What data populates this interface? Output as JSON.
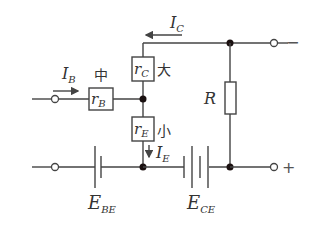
{
  "diagram": {
    "type": "transistor equivalent circuit",
    "components": {
      "rB": {
        "symbol": "r",
        "subscript": "B",
        "annotation": "中"
      },
      "rC": {
        "symbol": "r",
        "subscript": "C",
        "annotation": "大"
      },
      "rE": {
        "symbol": "r",
        "subscript": "E",
        "annotation": "小"
      },
      "R": {
        "symbol": "R"
      },
      "EBE": {
        "symbol": "E",
        "subscript": "BE"
      },
      "ECE": {
        "symbol": "E",
        "subscript": "CE"
      }
    },
    "currents": {
      "IB": {
        "symbol": "I",
        "subscript": "B",
        "direction": "right"
      },
      "IC": {
        "symbol": "I",
        "subscript": "C",
        "direction": "left"
      },
      "IE": {
        "symbol": "I",
        "subscript": "E",
        "direction": "down"
      }
    },
    "terminals": {
      "top_right_sign": "−",
      "bottom_right_sign": "+"
    }
  }
}
